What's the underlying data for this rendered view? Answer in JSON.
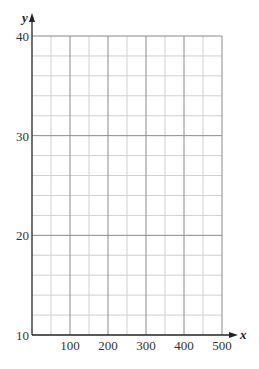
{
  "chart_data": {
    "type": "line",
    "title": "",
    "xlabel": "x",
    "ylabel": "y",
    "xlim": [
      0,
      500
    ],
    "ylim": [
      10,
      40
    ],
    "x_ticks": [
      100,
      200,
      300,
      400,
      500
    ],
    "x_tick_labels": [
      "100",
      "200",
      "300",
      "400",
      "500"
    ],
    "y_ticks": [
      10,
      20,
      30,
      40
    ],
    "y_tick_labels": [
      "10",
      "20",
      "30",
      "40"
    ],
    "grid": true,
    "x_minor_step": 50,
    "y_minor_step": 2,
    "series": []
  },
  "colors": {
    "major_grid": "#8a8a8a",
    "minor_grid": "#d0d0d0",
    "axis": "#222222"
  }
}
